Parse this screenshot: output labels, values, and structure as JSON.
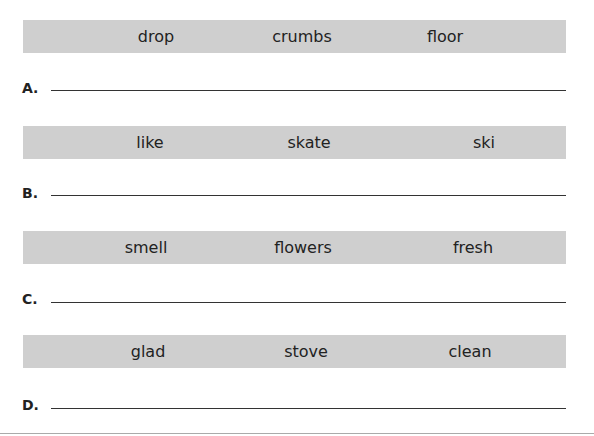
{
  "rows": [
    {
      "label": "A.",
      "words": [
        "drop",
        "crumbs",
        "floor"
      ]
    },
    {
      "label": "B.",
      "words": [
        "like",
        "skate",
        "ski"
      ]
    },
    {
      "label": "C.",
      "words": [
        "smell",
        "flowers",
        "fresh"
      ]
    },
    {
      "label": "D.",
      "words": [
        "glad",
        "stove",
        "clean"
      ]
    }
  ]
}
